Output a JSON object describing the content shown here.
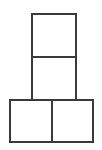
{
  "figure": {
    "name": "square-stack-figure",
    "background_color": "#ffffff",
    "stroke_color": "#3a3a3a",
    "stroke_width": 2,
    "canvas": {
      "width": 102,
      "height": 150
    },
    "squares": [
      {
        "id": "top-square",
        "label": "",
        "x": 32,
        "y": 14,
        "width": 44,
        "height": 43
      },
      {
        "id": "middle-square",
        "label": "",
        "x": 32,
        "y": 57,
        "width": 44,
        "height": 43
      },
      {
        "id": "bottom-left-square",
        "label": "",
        "x": 10,
        "y": 100,
        "width": 42,
        "height": 42
      },
      {
        "id": "bottom-right-square",
        "label": "",
        "x": 52,
        "y": 100,
        "width": 41,
        "height": 42
      }
    ]
  }
}
